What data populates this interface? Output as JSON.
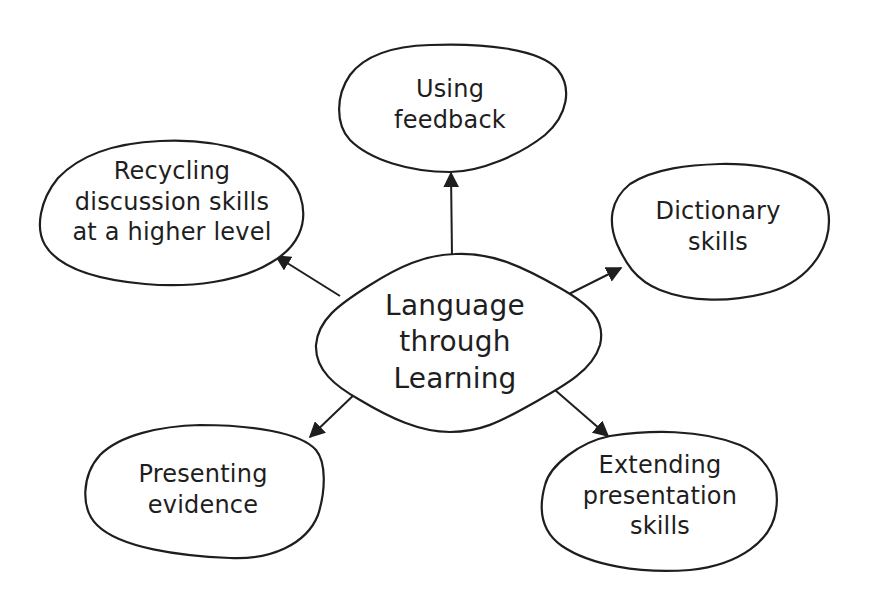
{
  "diagram": {
    "type": "mind-map",
    "center": {
      "id": "center",
      "lines": [
        "Language",
        "through",
        "Learning"
      ]
    },
    "nodes": [
      {
        "id": "using-feedback",
        "lines": [
          "Using",
          "feedback"
        ]
      },
      {
        "id": "recycling-discussion",
        "lines": [
          "Recycling",
          "discussion skills",
          "at a higher level"
        ]
      },
      {
        "id": "dictionary-skills",
        "lines": [
          "Dictionary",
          "skills"
        ]
      },
      {
        "id": "presenting-evidence",
        "lines": [
          "Presenting",
          "evidence"
        ]
      },
      {
        "id": "extending-presentation",
        "lines": [
          "Extending",
          "presentation",
          "skills"
        ]
      }
    ],
    "edges": [
      {
        "from": "center",
        "to": "using-feedback"
      },
      {
        "from": "center",
        "to": "recycling-discussion"
      },
      {
        "from": "center",
        "to": "dictionary-skills"
      },
      {
        "from": "center",
        "to": "presenting-evidence"
      },
      {
        "from": "center",
        "to": "extending-presentation"
      }
    ],
    "colors": {
      "stroke": "#1e1e1e",
      "background": "#ffffff"
    }
  }
}
